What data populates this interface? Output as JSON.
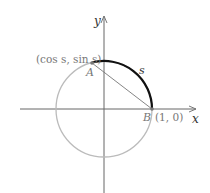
{
  "diagram": {
    "axis_x_label": "x",
    "axis_y_label": "y",
    "point_a_label": "A",
    "point_b_label": "B",
    "point_a_coords": "(cos s, sin s)",
    "point_b_coords": "(1, 0)",
    "arc_label": "s",
    "colors": {
      "circle": "#bbbbbb",
      "arc": "#111111",
      "axes": "#555555",
      "chord": "#666666"
    }
  }
}
